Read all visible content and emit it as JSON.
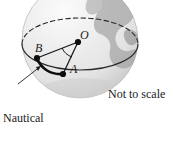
{
  "figure": {
    "kind": "geometry-diagram-sphere",
    "caption_left": "Nautical\nmile",
    "caption_left_line1": "Nautical",
    "caption_left_line2": "mile",
    "caption_right": "Not to scale",
    "points": [
      {
        "id": "O",
        "label": "O",
        "role": "sphere-center",
        "x": 78,
        "y": 42
      },
      {
        "id": "A",
        "label": "A",
        "role": "arc-endpoint",
        "x": 63,
        "y": 74
      },
      {
        "id": "B",
        "label": "B",
        "role": "arc-endpoint",
        "x": 37,
        "y": 58
      }
    ],
    "colors": {
      "ink": "#1a1a1a",
      "sphere_fill": "#ececec",
      "sphere_highlight": "#f8f8f8",
      "sphere_shadow": "#cfcfcf",
      "landmass": "#9a9a9a",
      "background": "#ffffff"
    },
    "elements": {
      "sphere": "shaded sphere (globe) clipped at top of frame",
      "great_circle_front": "solid ellipse arc front half",
      "great_circle_back": "dashed ellipse arc back half",
      "radius_OA": "line from center O to point A",
      "radius_OB": "line from center O to point B",
      "angle_arc_O": "small arc marking the central angle AOB",
      "arc_BA": "thick great-circle arc between B and A (the nautical mile)",
      "leader_line": "pointer from Nautical mile caption to arc BA"
    }
  }
}
